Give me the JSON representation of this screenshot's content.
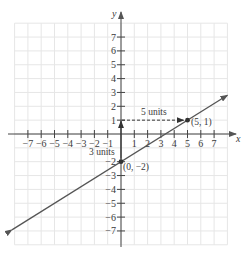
{
  "chart_data": {
    "type": "line",
    "title": "",
    "xlabel": "x",
    "ylabel": "y",
    "xlim": [
      -8,
      8
    ],
    "ylim": [
      -8,
      8
    ],
    "grid": true,
    "x_ticks": [
      -7,
      -6,
      -5,
      -4,
      -3,
      -2,
      -1,
      1,
      2,
      3,
      4,
      5,
      6,
      7
    ],
    "y_ticks": [
      7,
      6,
      5,
      4,
      3,
      2,
      1,
      -2,
      -3,
      -4,
      -5,
      -6,
      -7
    ],
    "x_tick_labels": [
      "−7",
      "−6",
      "−5",
      "−4",
      "−3",
      "−2",
      "−1",
      "1",
      "2",
      "3",
      "4",
      "5",
      "6",
      "7"
    ],
    "y_tick_labels": [
      "7",
      "6",
      "5",
      "4",
      "3",
      "2",
      "1",
      "−2",
      "−3",
      "−4",
      "−5",
      "−6",
      "−7"
    ],
    "series": [
      {
        "name": "line",
        "equation": "y = 3/5 x − 2",
        "x": [
          -8.2,
          8.0
        ],
        "y": [
          -6.92,
          2.8
        ]
      }
    ],
    "points": [
      {
        "x": 0,
        "y": -2,
        "label": "(0, −2)"
      },
      {
        "x": 5,
        "y": 1,
        "label": "(5, 1)"
      }
    ],
    "annotations": [
      {
        "text": "5 units",
        "type": "horizontal-run",
        "from": [
          0,
          1
        ],
        "to": [
          5,
          1
        ]
      },
      {
        "text": "3 units",
        "type": "vertical-rise",
        "from": [
          0,
          -2
        ],
        "to": [
          0,
          1
        ]
      }
    ]
  },
  "labels": {
    "x_axis": "x",
    "y_axis": "y",
    "run": "5 units",
    "rise": "3 units",
    "point_a": "(5, 1)",
    "point_b": "(0, −2)"
  }
}
